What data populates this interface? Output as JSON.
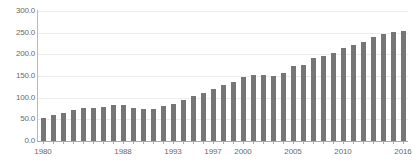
{
  "chart_data": {
    "type": "bar",
    "title": "",
    "subtitle": "",
    "xlabel": "",
    "ylabel": "",
    "grid": true,
    "legend": "none",
    "bar_color": "#767676",
    "axis_color": "#a8a8a8",
    "gridline_color": "#ececec",
    "tick_label_color": "#6a6a6a",
    "ylim": [
      0.0,
      300.0
    ],
    "ytick_labels": [
      "300.0",
      "250.0",
      "200.0",
      "150.0",
      "100.0",
      "50.0",
      "0.0"
    ],
    "ytick_values": [
      300.0,
      250.0,
      200.0,
      150.0,
      100.0,
      50.0,
      0.0
    ],
    "xtick_labels": [
      "1980",
      "1988",
      "1993",
      "1997",
      "2000",
      "2005",
      "2010",
      "2016"
    ],
    "xtick_values": [
      1980,
      1988,
      1993,
      1997,
      2000,
      2005,
      2010,
      2016
    ],
    "categories": [
      "1980",
      "1981",
      "1982",
      "1983",
      "1984",
      "1985",
      "1986",
      "1987",
      "1988",
      "1989",
      "1990",
      "1991",
      "1992",
      "1993",
      "1994",
      "1995",
      "1996",
      "1997",
      "1998",
      "1999",
      "2000",
      "2001",
      "2002",
      "2003",
      "2004",
      "2005",
      "2006",
      "2007",
      "2008",
      "2009",
      "2010",
      "2011",
      "2012",
      "2013",
      "2014",
      "2015",
      "2016"
    ],
    "values": [
      52,
      60,
      64,
      71,
      76,
      76,
      79,
      83,
      82,
      76,
      75,
      75,
      80,
      85,
      95,
      103,
      110,
      120,
      129,
      136,
      148,
      153,
      152,
      151,
      158,
      173,
      176,
      192,
      196,
      203,
      214,
      222,
      229,
      240,
      248,
      251,
      254
    ]
  }
}
